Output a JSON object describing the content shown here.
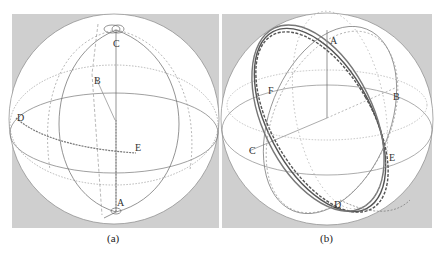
{
  "figure": {
    "panels": [
      {
        "id": "a",
        "caption": "(a)",
        "points": {
          "A": "A",
          "B": "B",
          "C": "C",
          "D": "D",
          "E": "E"
        }
      },
      {
        "id": "b",
        "caption": "(b)",
        "points": {
          "A": "A",
          "B": "B",
          "C": "C",
          "D": "D",
          "E": "E",
          "F": "F"
        }
      }
    ],
    "colors": {
      "background": "#cfcfcf",
      "sphere": "#ffffff",
      "lines": "#555555"
    }
  }
}
